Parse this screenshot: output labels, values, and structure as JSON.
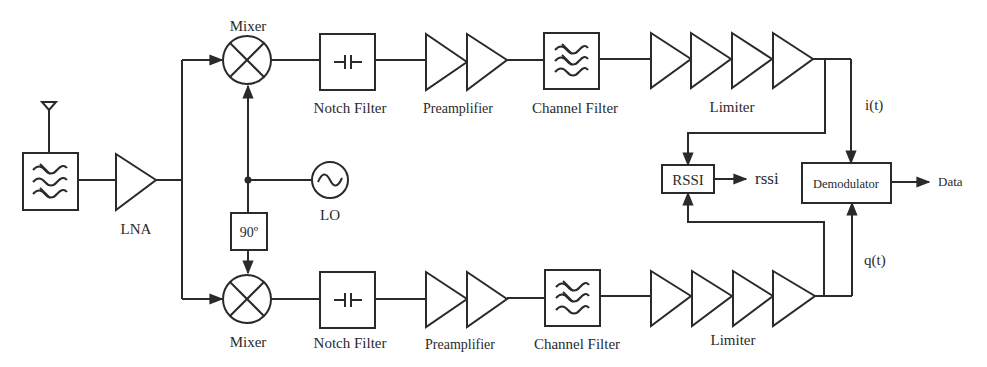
{
  "diagram": {
    "type": "block-diagram",
    "colors": {
      "stroke": "#2a2a2a",
      "background": "#ffffff"
    },
    "front_end": {
      "antenna": "antenna-icon",
      "input_filter": {
        "icon": "bandpass-filter-icon"
      },
      "lna": {
        "label": "LNA"
      }
    },
    "local_oscillator": {
      "lo": {
        "label": "LO",
        "icon": "sine-wave-icon"
      },
      "phase_shift": {
        "label": "90º"
      }
    },
    "i_path": {
      "mixer": {
        "label": "Mixer"
      },
      "notch_filter": {
        "label": "Notch Filter"
      },
      "preamplifier": {
        "label": "Preamplifier"
      },
      "channel_filter": {
        "label": "Channel Filter"
      },
      "limiter": {
        "label": "Limiter"
      },
      "signal": {
        "label": "i(t)"
      }
    },
    "q_path": {
      "mixer": {
        "label": "Mixer"
      },
      "notch_filter": {
        "label": "Notch Filter"
      },
      "preamplifier": {
        "label": "Preamplifier"
      },
      "channel_filter": {
        "label": "Channel Filter"
      },
      "limiter": {
        "label": "Limiter"
      },
      "signal": {
        "label": "q(t)"
      }
    },
    "back_end": {
      "rssi": {
        "label": "RSSI",
        "output": "rssi"
      },
      "demodulator": {
        "label": "Demodulator",
        "output": "Data"
      }
    }
  }
}
